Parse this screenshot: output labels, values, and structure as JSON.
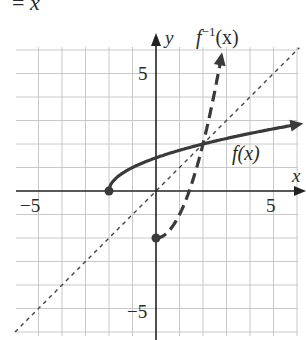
{
  "header_fragment": {
    "equals": "=",
    "variable": "x"
  },
  "chart_data": {
    "type": "line",
    "title": "",
    "xlabel": "x",
    "ylabel": "y",
    "xlim": [
      -6,
      6
    ],
    "ylim": [
      -6,
      6
    ],
    "grid": true,
    "tick_labels": {
      "x": [
        "-5",
        "5"
      ],
      "y": [
        "5",
        "-5"
      ]
    },
    "series": [
      {
        "name": "f(x)",
        "label": "f(x)",
        "style": "solid",
        "formula": "sqrt(x + 2)",
        "start_point": [
          -2,
          0
        ],
        "start_closed": true,
        "end_arrow": true,
        "points": [
          [
            -2,
            0
          ],
          [
            -1.75,
            0.5
          ],
          [
            -1,
            1
          ],
          [
            0,
            1.41
          ],
          [
            1,
            1.73
          ],
          [
            2,
            2
          ],
          [
            3,
            2.24
          ],
          [
            4,
            2.45
          ],
          [
            6,
            2.83
          ]
        ]
      },
      {
        "name": "f^-1(x)",
        "label": "f⁻¹(x)",
        "style": "dashed",
        "formula": "x^2 - 2, x >= 0",
        "start_point": [
          0,
          -2
        ],
        "start_closed": true,
        "end_arrow": true,
        "points": [
          [
            0,
            -2
          ],
          [
            0.5,
            -1.75
          ],
          [
            1,
            -1
          ],
          [
            1.5,
            0.25
          ],
          [
            2,
            2
          ],
          [
            2.5,
            4.25
          ],
          [
            2.83,
            6
          ]
        ]
      },
      {
        "name": "y = x",
        "label": "",
        "style": "dotted",
        "formula": "x",
        "points": [
          [
            -6,
            -6
          ],
          [
            6,
            6
          ]
        ]
      }
    ],
    "annotations": [
      {
        "text": "f(x)",
        "at": [
          3.6,
          1.3
        ]
      },
      {
        "text": "f⁻¹(x)",
        "at": [
          2.9,
          6.4
        ]
      },
      {
        "text": "x",
        "at": [
          6.1,
          0.5
        ]
      },
      {
        "text": "y",
        "at": [
          0.5,
          6.1
        ]
      }
    ],
    "intersection": [
      2,
      2
    ]
  },
  "labels": {
    "x_axis": "x",
    "y_axis": "y",
    "f": "f(x)",
    "finv_f": "f",
    "finv_sup": "−1",
    "finv_arg": "(x)",
    "tick_x_neg5": "−5",
    "tick_x_5": "5",
    "tick_y_5": "5",
    "tick_y_neg5": "−5"
  }
}
